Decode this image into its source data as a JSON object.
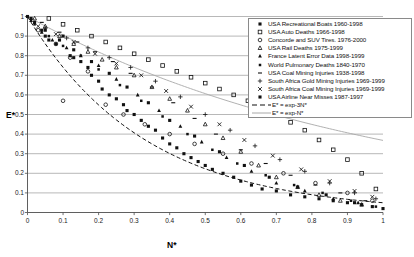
{
  "chart_data": {
    "type": "scatter",
    "title": "",
    "xlabel": "N*",
    "ylabel": "E*",
    "xlim": [
      0,
      1
    ],
    "ylim": [
      0,
      1
    ],
    "xticks": [
      "0",
      "0.1",
      "0.2",
      "0.3",
      "0.4",
      "0.5",
      "0.6",
      "0.7",
      "0.8",
      "0.9",
      "1"
    ],
    "yticks": [
      "0",
      "0.1",
      "0.2",
      "0.3",
      "0.4",
      "0.5",
      "0.6",
      "0.7",
      "0.8",
      "0.9",
      "1"
    ],
    "grid": "horizontal",
    "legend_position": "top-right",
    "series": [
      {
        "name": "USA Recreational Boats 1960-1998",
        "marker": "filled-square",
        "points": [
          [
            0.0,
            1.0
          ],
          [
            0.02,
            0.97
          ],
          [
            0.04,
            0.93
          ],
          [
            0.05,
            0.9
          ],
          [
            0.06,
            0.88
          ],
          [
            0.08,
            0.86
          ],
          [
            0.1,
            0.9
          ],
          [
            0.12,
            0.8
          ],
          [
            0.13,
            0.79
          ],
          [
            0.15,
            0.77
          ],
          [
            0.17,
            0.74
          ],
          [
            0.18,
            0.7
          ],
          [
            0.2,
            0.67
          ],
          [
            0.21,
            0.63
          ],
          [
            0.23,
            0.6
          ],
          [
            0.25,
            0.58
          ],
          [
            0.27,
            0.55
          ],
          [
            0.28,
            0.52
          ],
          [
            0.3,
            0.5
          ],
          [
            0.32,
            0.47
          ],
          [
            0.34,
            0.44
          ],
          [
            0.36,
            0.42
          ],
          [
            0.38,
            0.38
          ],
          [
            0.4,
            0.35
          ],
          [
            0.42,
            0.33
          ],
          [
            0.44,
            0.3
          ],
          [
            0.46,
            0.28
          ],
          [
            0.48,
            0.26
          ],
          [
            0.5,
            0.24
          ],
          [
            0.52,
            0.22
          ],
          [
            0.55,
            0.2
          ],
          [
            0.58,
            0.18
          ],
          [
            0.6,
            0.16
          ],
          [
            0.63,
            0.14
          ],
          [
            0.66,
            0.12
          ],
          [
            0.7,
            0.11
          ],
          [
            0.74,
            0.09
          ],
          [
            0.78,
            0.08
          ],
          [
            0.82,
            0.07
          ],
          [
            0.86,
            0.06
          ],
          [
            0.9,
            0.05
          ],
          [
            0.94,
            0.04
          ],
          [
            0.97,
            0.03
          ],
          [
            1.0,
            0.02
          ]
        ]
      },
      {
        "name": "USA Auto Deaths 1966-1998",
        "marker": "open-square",
        "points": [
          [
            0.06,
            0.99
          ],
          [
            0.1,
            0.96
          ],
          [
            0.14,
            0.93
          ],
          [
            0.18,
            0.9
          ],
          [
            0.22,
            0.87
          ],
          [
            0.26,
            0.84
          ],
          [
            0.3,
            0.81
          ],
          [
            0.34,
            0.78
          ],
          [
            0.38,
            0.75
          ],
          [
            0.42,
            0.72
          ],
          [
            0.46,
            0.69
          ],
          [
            0.5,
            0.66
          ],
          [
            0.54,
            0.63
          ],
          [
            0.58,
            0.6
          ],
          [
            0.62,
            0.57
          ],
          [
            0.66,
            0.54
          ],
          [
            0.7,
            0.5
          ],
          [
            0.74,
            0.46
          ],
          [
            0.78,
            0.42
          ],
          [
            0.82,
            0.37
          ],
          [
            0.86,
            0.32
          ],
          [
            0.9,
            0.27
          ],
          [
            0.94,
            0.2
          ],
          [
            0.98,
            0.12
          ]
        ]
      },
      {
        "name": "Concorde and SUV Tires. 1976-2000",
        "marker": "open-circle",
        "points": [
          [
            0.03,
            0.93
          ],
          [
            0.08,
            0.86
          ],
          [
            0.12,
            0.79
          ],
          [
            0.17,
            0.72
          ],
          [
            0.1,
            0.57
          ],
          [
            0.22,
            0.55
          ],
          [
            0.27,
            0.5
          ],
          [
            0.33,
            0.45
          ],
          [
            0.4,
            0.4
          ],
          [
            0.47,
            0.35
          ],
          [
            0.55,
            0.3
          ],
          [
            0.63,
            0.25
          ],
          [
            0.72,
            0.2
          ],
          [
            0.81,
            0.15
          ],
          [
            0.9,
            0.1
          ],
          [
            0.97,
            0.06
          ]
        ]
      },
      {
        "name": "USA Rail Deaths 1975-1999",
        "marker": "open-triangle",
        "points": [
          [
            0.02,
            0.99
          ],
          [
            0.05,
            0.95
          ],
          [
            0.09,
            0.9
          ],
          [
            0.13,
            0.86
          ],
          [
            0.17,
            0.82
          ],
          [
            0.21,
            0.78
          ],
          [
            0.25,
            0.74
          ],
          [
            0.3,
            0.7
          ],
          [
            0.35,
            0.64
          ],
          [
            0.4,
            0.58
          ],
          [
            0.45,
            0.52
          ],
          [
            0.5,
            0.45
          ],
          [
            0.55,
            0.38
          ],
          [
            0.6,
            0.31
          ],
          [
            0.65,
            0.24
          ],
          [
            0.7,
            0.18
          ],
          [
            0.76,
            0.13
          ],
          [
            0.82,
            0.09
          ],
          [
            0.88,
            0.06
          ],
          [
            0.94,
            0.04
          ]
        ]
      },
      {
        "name": "France Latent Error Data 1998-1999",
        "marker": "filled-triangle",
        "points": [
          [
            0.01,
            0.98
          ],
          [
            0.04,
            0.92
          ],
          [
            0.07,
            0.88
          ],
          [
            0.11,
            0.84
          ],
          [
            0.15,
            0.8
          ],
          [
            0.2,
            0.75
          ],
          [
            0.25,
            0.68
          ],
          [
            0.31,
            0.6
          ],
          [
            0.37,
            0.52
          ],
          [
            0.43,
            0.44
          ],
          [
            0.49,
            0.36
          ],
          [
            0.56,
            0.28
          ],
          [
            0.63,
            0.21
          ],
          [
            0.7,
            0.15
          ],
          [
            0.78,
            0.11
          ],
          [
            0.86,
            0.07
          ],
          [
            0.93,
            0.05
          ]
        ]
      },
      {
        "name": "World Pulmonary Deaths 1840-1970",
        "marker": "filled-square-small",
        "points": [
          [
            0.02,
            0.96
          ],
          [
            0.06,
            0.9
          ],
          [
            0.1,
            0.85
          ],
          [
            0.15,
            0.8
          ],
          [
            0.2,
            0.73
          ],
          [
            0.26,
            0.65
          ],
          [
            0.32,
            0.57
          ],
          [
            0.38,
            0.49
          ],
          [
            0.45,
            0.4
          ],
          [
            0.52,
            0.32
          ],
          [
            0.59,
            0.25
          ],
          [
            0.67,
            0.19
          ],
          [
            0.75,
            0.14
          ],
          [
            0.83,
            0.1
          ],
          [
            0.91,
            0.06
          ],
          [
            0.98,
            0.03
          ]
        ]
      },
      {
        "name": "USA Coal Mining Injuries 1938-1998",
        "marker": "dash",
        "points": [
          [
            0.04,
            0.97
          ],
          [
            0.09,
            0.92
          ],
          [
            0.14,
            0.87
          ],
          [
            0.19,
            0.82
          ],
          [
            0.24,
            0.77
          ],
          [
            0.29,
            0.71
          ],
          [
            0.35,
            0.64
          ],
          [
            0.41,
            0.56
          ],
          [
            0.47,
            0.48
          ],
          [
            0.53,
            0.4
          ],
          [
            0.6,
            0.32
          ],
          [
            0.67,
            0.25
          ],
          [
            0.74,
            0.19
          ],
          [
            0.81,
            0.14
          ],
          [
            0.88,
            0.1
          ],
          [
            0.95,
            0.06
          ]
        ]
      },
      {
        "name": "South Africa Gold Mining Injuries 1969-1999",
        "marker": "plus",
        "points": [
          [
            0.05,
            0.94
          ],
          [
            0.11,
            0.89
          ],
          [
            0.17,
            0.84
          ],
          [
            0.23,
            0.79
          ],
          [
            0.29,
            0.74
          ],
          [
            0.36,
            0.67
          ],
          [
            0.43,
            0.59
          ],
          [
            0.5,
            0.5
          ],
          [
            0.57,
            0.42
          ],
          [
            0.64,
            0.34
          ],
          [
            0.71,
            0.27
          ],
          [
            0.78,
            0.21
          ],
          [
            0.85,
            0.15
          ],
          [
            0.92,
            0.1
          ],
          [
            0.98,
            0.07
          ]
        ]
      },
      {
        "name": "South Africa Coal Mining Injuries 1969-1999",
        "marker": "cross",
        "points": [
          [
            0.03,
            0.95
          ],
          [
            0.08,
            0.91
          ],
          [
            0.13,
            0.87
          ],
          [
            0.19,
            0.81
          ],
          [
            0.25,
            0.76
          ],
          [
            0.32,
            0.7
          ],
          [
            0.39,
            0.62
          ],
          [
            0.46,
            0.54
          ],
          [
            0.54,
            0.45
          ],
          [
            0.61,
            0.37
          ],
          [
            0.69,
            0.29
          ],
          [
            0.77,
            0.22
          ],
          [
            0.85,
            0.16
          ],
          [
            0.92,
            0.11
          ],
          [
            0.97,
            0.08
          ]
        ]
      },
      {
        "name": "USA Airline Near Misses 1987-1997",
        "marker": "filled-square",
        "points": [
          [
            0.01,
            0.99
          ],
          [
            0.05,
            0.93
          ],
          [
            0.09,
            0.88
          ],
          [
            0.13,
            0.83
          ],
          [
            0.18,
            0.77
          ],
          [
            0.23,
            0.71
          ],
          [
            0.28,
            0.64
          ],
          [
            0.34,
            0.56
          ],
          [
            0.4,
            0.47
          ],
          [
            0.47,
            0.39
          ],
          [
            0.54,
            0.31
          ],
          [
            0.61,
            0.24
          ],
          [
            0.68,
            0.18
          ],
          [
            0.76,
            0.13
          ],
          [
            0.84,
            0.09
          ],
          [
            0.92,
            0.05
          ]
        ]
      }
    ],
    "curves": [
      {
        "name": "E* = exp-3N*",
        "style": "dashed",
        "formula": "exp(-3x)"
      },
      {
        "name": "E* = exp-N*",
        "style": "solid",
        "formula": "exp(-x)"
      }
    ]
  },
  "legend": {
    "entries": [
      {
        "label": "USA Recreational Boats 1960-1998",
        "marker": "filled-square"
      },
      {
        "label": "USA Auto Deaths 1966-1998",
        "marker": "open-square"
      },
      {
        "label": "Concorde and SUV Tires. 1976-2000",
        "marker": "open-circle"
      },
      {
        "label": "USA Rail Deaths 1975-1999",
        "marker": "open-triangle"
      },
      {
        "label": "France Latent Error Data 1998-1999",
        "marker": "filled-triangle"
      },
      {
        "label": "World Pulmonary Deaths 1840-1970",
        "marker": "filled-square-small"
      },
      {
        "label": "USA Coal Mining Injuries 1938-1998",
        "marker": "dash"
      },
      {
        "label": "South Africa Gold Mining Injuries 1969-1999",
        "marker": "plus"
      },
      {
        "label": "South Africa Coal Mining Injuries 1969-1999",
        "marker": "cross"
      },
      {
        "label": "USA Airline Near Misses 1987-1997",
        "marker": "filled-square"
      }
    ],
    "curve_entries": [
      {
        "label": "E* = exp-3N*",
        "style": "dashed"
      },
      {
        "label": "E* = exp-N*",
        "style": "solid"
      }
    ]
  },
  "colors": {
    "marker": "#111111",
    "grid": "#9a9a9a",
    "axis": "#4d4d4d",
    "curve_dashed": "#111111",
    "curve_solid": "#a8a8a8",
    "legend_border": "#8a8a8a",
    "background": "#ffffff"
  }
}
